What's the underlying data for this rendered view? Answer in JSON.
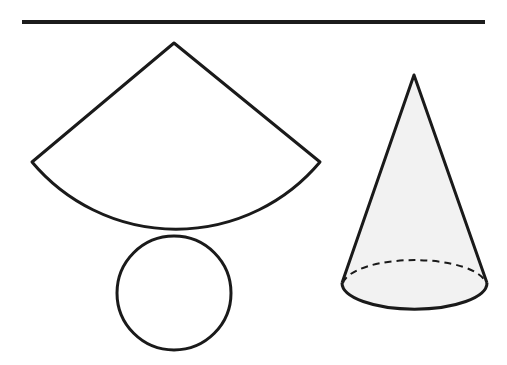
{
  "header": {
    "heading_clipped_text": "",
    "rule_color": "#1c1c1c"
  },
  "figure": {
    "stroke_color": "#1a1a1a",
    "cone_fill": "#f2f2f2",
    "net": {
      "sector": {
        "apex": [
          174,
          43
        ],
        "left": [
          32,
          162
        ],
        "right": [
          320,
          162
        ],
        "arc_radius": 188
      },
      "circle": {
        "cx": 174,
        "cy": 293,
        "r": 57
      }
    },
    "cone": {
      "apex": [
        414,
        75
      ],
      "base_cx": 414,
      "base_cy": 285,
      "base_rx": 72,
      "base_ry": 26
    }
  }
}
